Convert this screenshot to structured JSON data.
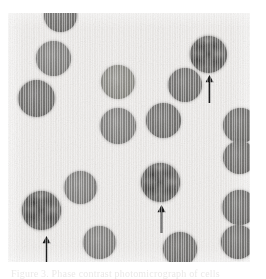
{
  "figure": {
    "kind": "photomicrograph",
    "caption_clipped": "Figure 3. Phase contrast photomicrograph of cells",
    "arrow_count": 3,
    "cell_count": 18
  },
  "colors": {
    "page": "#ffffff",
    "plate_background": "#eceae8",
    "cell_medium": "#7b7a78",
    "cell_dark": "#6e6d6b",
    "cell_light": "#86857f",
    "cell_mottled": "#6a6967",
    "arrow": "#111111"
  },
  "plate": {
    "x": 8,
    "y": 13,
    "width": 242,
    "height": 249
  },
  "cells": [
    {
      "name": "cell-top-edge-clipped",
      "x": 36,
      "y": -14,
      "d": 33,
      "tone": "dark",
      "label": "clipped cell at top edge"
    },
    {
      "name": "cell-upper-left",
      "x": 28,
      "y": 28,
      "d": 35,
      "tone": "plain",
      "label": "upper-left cell"
    },
    {
      "name": "cell-mid-left",
      "x": 10,
      "y": 67,
      "d": 37,
      "tone": "dark",
      "label": "middle-left cell"
    },
    {
      "name": "cell-upper-center",
      "x": 93,
      "y": 52,
      "d": 34,
      "tone": "light",
      "label": "upper-center cell"
    },
    {
      "name": "cell-center-left",
      "x": 92,
      "y": 95,
      "d": 36,
      "tone": "plain",
      "label": "center-left cell"
    },
    {
      "name": "cell-center",
      "x": 138,
      "y": 90,
      "d": 35,
      "tone": "dark",
      "label": "center cell"
    },
    {
      "name": "cell-upper-right-mid",
      "x": 160,
      "y": 55,
      "d": 34,
      "tone": "dark",
      "label": "upper-right middle cell"
    },
    {
      "name": "cell-arrow-upper-right",
      "x": 182,
      "y": 23,
      "d": 37,
      "tone": "mottled",
      "label": "arrow-marked cell, upper right"
    },
    {
      "name": "cell-right-edge-1",
      "x": 215,
      "y": 95,
      "d": 35,
      "tone": "dark",
      "label": "right edge cell 1"
    },
    {
      "name": "cell-right-edge-2",
      "x": 215,
      "y": 128,
      "d": 33,
      "tone": "dark",
      "label": "right edge cell 2"
    },
    {
      "name": "cell-right-sliver",
      "x": 247,
      "y": 131,
      "d": 26,
      "tone": "dark",
      "label": "right edge sliver cell"
    },
    {
      "name": "cell-right-edge-3",
      "x": 214,
      "y": 177,
      "d": 35,
      "tone": "dark",
      "label": "right edge cell 3"
    },
    {
      "name": "cell-right-edge-4",
      "x": 213,
      "y": 212,
      "d": 34,
      "tone": "dark",
      "label": "right edge cell 4"
    },
    {
      "name": "cell-lower-mid-left",
      "x": 56,
      "y": 158,
      "d": 33,
      "tone": "plain",
      "label": "lower middle-left cell"
    },
    {
      "name": "cell-arrow-lower-left",
      "x": 14,
      "y": 178,
      "d": 39,
      "tone": "mottled",
      "label": "arrow-marked cell, lower left"
    },
    {
      "name": "cell-bottom-left",
      "x": 75,
      "y": 213,
      "d": 33,
      "tone": "plain",
      "label": "bottom-left cell"
    },
    {
      "name": "cell-arrow-center",
      "x": 133,
      "y": 150,
      "d": 39,
      "tone": "mottled",
      "label": "arrow-marked cell, center"
    },
    {
      "name": "cell-bottom-center",
      "x": 155,
      "y": 219,
      "d": 34,
      "tone": "dark",
      "label": "bottom-center cell"
    }
  ],
  "arrows": [
    {
      "name": "arrow-upper-right",
      "x": 196,
      "y": 62,
      "h": 28,
      "points_to": "cell-arrow-upper-right"
    },
    {
      "name": "arrow-center",
      "x": 148,
      "y": 192,
      "h": 28,
      "points_to": "cell-arrow-center"
    },
    {
      "name": "arrow-lower-left",
      "x": 33,
      "y": 223,
      "h": 28,
      "points_to": "cell-arrow-lower-left"
    }
  ]
}
